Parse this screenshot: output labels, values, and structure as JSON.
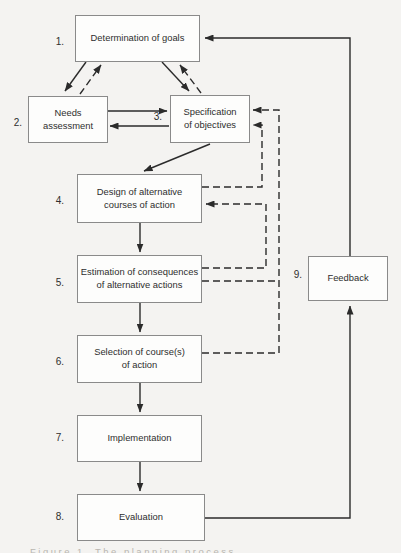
{
  "colors": {
    "background": "#f4f3f1",
    "line": "#2b2b2b",
    "box_border": "#8a8a8a",
    "box_fill": "#fdfdfc",
    "text": "#2e2e2e"
  },
  "boxes": [
    {
      "number": "1.",
      "line1": "Determination of goals",
      "line2": ""
    },
    {
      "number": "2.",
      "line1": "Needs",
      "line2": "assessment"
    },
    {
      "number": "3.",
      "line1": "Specification",
      "line2": "of objectives"
    },
    {
      "number": "4.",
      "line1": "Design of alternative",
      "line2": "courses of action"
    },
    {
      "number": "5.",
      "line1": "Estimation of consequences",
      "line2": "of alternative actions"
    },
    {
      "number": "6.",
      "line1": "Selection of course(s)",
      "line2": "of action"
    },
    {
      "number": "7.",
      "line1": "Implementation",
      "line2": ""
    },
    {
      "number": "8.",
      "line1": "Evaluation",
      "line2": ""
    },
    {
      "number": "9.",
      "line1": "Feedback",
      "line2": ""
    }
  ],
  "partial_caption": "Figure 1. The planning process"
}
